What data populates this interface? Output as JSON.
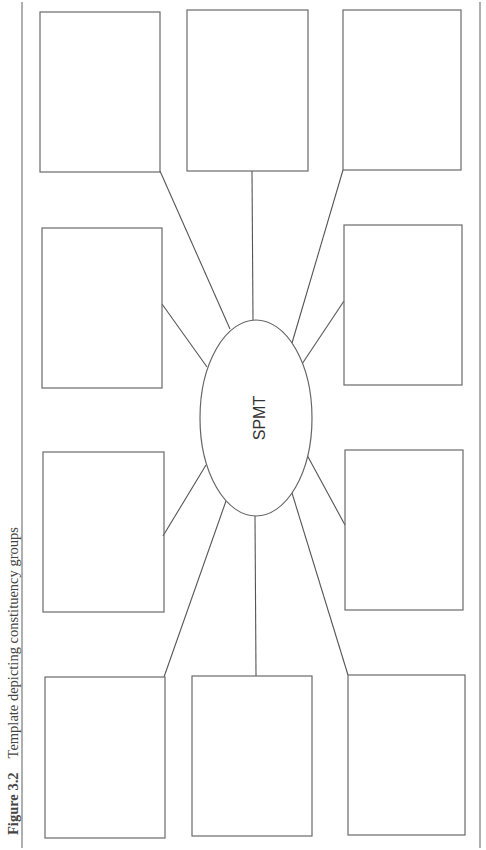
{
  "figure": {
    "number": "Figure 3.2",
    "caption": "Template depicting constituency groups"
  },
  "diagram": {
    "center": {
      "label": "SPMT",
      "shape": "ellipse",
      "cx": 256,
      "cy": 418,
      "rx": 56,
      "ry": 98
    },
    "boxes": [
      {
        "id": "top-left",
        "label": "",
        "x": 40,
        "y": 12,
        "w": 120,
        "h": 160
      },
      {
        "id": "top-center",
        "label": "",
        "x": 187,
        "y": 10,
        "w": 121,
        "h": 161
      },
      {
        "id": "top-right",
        "label": "",
        "x": 343,
        "y": 10,
        "w": 118,
        "h": 160
      },
      {
        "id": "mid-upper-left",
        "label": "",
        "x": 42,
        "y": 228,
        "w": 120,
        "h": 160
      },
      {
        "id": "mid-upper-right",
        "label": "",
        "x": 344,
        "y": 225,
        "w": 118,
        "h": 160
      },
      {
        "id": "mid-lower-left",
        "label": "",
        "x": 43,
        "y": 452,
        "w": 121,
        "h": 160
      },
      {
        "id": "mid-lower-right",
        "label": "",
        "x": 345,
        "y": 450,
        "w": 118,
        "h": 160
      },
      {
        "id": "bottom-left",
        "label": "",
        "x": 45,
        "y": 677,
        "w": 120,
        "h": 161
      },
      {
        "id": "bottom-center",
        "label": "",
        "x": 192,
        "y": 676,
        "w": 120,
        "h": 160
      },
      {
        "id": "bottom-right",
        "label": "",
        "x": 348,
        "y": 675,
        "w": 117,
        "h": 160
      }
    ],
    "connectors": [
      {
        "from": "top-left",
        "x1": 160,
        "y1": 171,
        "x2": 230,
        "y2": 329
      },
      {
        "from": "top-center",
        "x1": 252,
        "y1": 171,
        "x2": 253,
        "y2": 320
      },
      {
        "from": "top-right",
        "x1": 343,
        "y1": 170,
        "x2": 292,
        "y2": 343
      },
      {
        "from": "mid-upper-left",
        "x1": 162,
        "y1": 304,
        "x2": 207,
        "y2": 367
      },
      {
        "from": "mid-upper-right",
        "x1": 344,
        "y1": 301,
        "x2": 302,
        "y2": 364
      },
      {
        "from": "mid-lower-left",
        "x1": 163,
        "y1": 536,
        "x2": 206,
        "y2": 465
      },
      {
        "from": "mid-lower-right",
        "x1": 345,
        "y1": 525,
        "x2": 307,
        "y2": 455
      },
      {
        "from": "bottom-left",
        "x1": 164,
        "y1": 677,
        "x2": 226,
        "y2": 501
      },
      {
        "from": "bottom-center",
        "x1": 256,
        "y1": 676,
        "x2": 255,
        "y2": 516
      },
      {
        "from": "bottom-right",
        "x1": 348,
        "y1": 675,
        "x2": 292,
        "y2": 493
      }
    ],
    "rules": [
      {
        "id": "left-rule",
        "x": 22,
        "y1": 2,
        "y2": 848
      },
      {
        "id": "right-rule",
        "x": 480,
        "y1": 2,
        "y2": 848
      }
    ],
    "colors": {
      "stroke": "#666666",
      "background": "#ffffff",
      "text": "#333333"
    }
  }
}
